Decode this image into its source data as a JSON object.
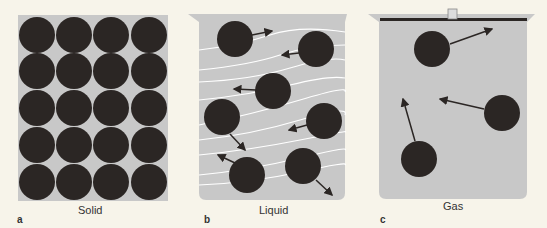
{
  "panels": [
    {
      "letter": "a",
      "caption": "Solid"
    },
    {
      "letter": "b",
      "caption": "Liquid"
    },
    {
      "letter": "c",
      "caption": "Gas"
    }
  ],
  "colors": {
    "background": "#f7f4ea",
    "fill": "#c8c8c8",
    "particle": "#2b2624",
    "flow_lines": "#ffffff"
  }
}
